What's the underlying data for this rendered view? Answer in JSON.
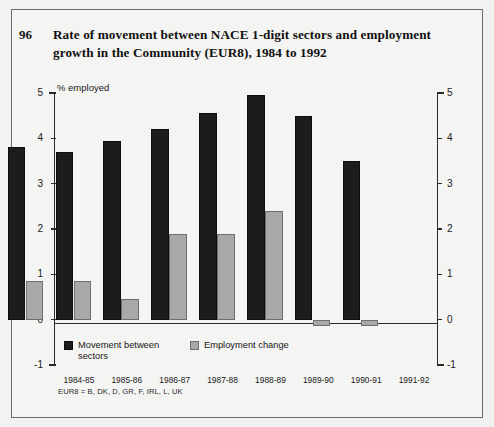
{
  "figure": {
    "number": "96",
    "title": "Rate of movement between NACE 1-digit sectors and employment growth in the Community (EUR8), 1984 to 1992",
    "unit_label": "% employed",
    "footnote": "EUR8 = B, DK, D, GR, F, IRL, L, UK"
  },
  "legend": {
    "items": [
      {
        "label": "Movement between sectors",
        "color": "#1c1c1c",
        "swatch": "black"
      },
      {
        "label": "Employment change",
        "color": "#a8a8a8",
        "swatch": "gray"
      }
    ]
  },
  "axis": {
    "y_ticks": [
      "5",
      "4",
      "3",
      "2",
      "1",
      "0",
      "-1"
    ],
    "y_ticks_right": [
      "5",
      "4",
      "3",
      "2",
      "1",
      "0",
      "-1"
    ]
  },
  "chart_data": {
    "type": "bar",
    "title": "Rate of movement between NACE 1-digit sectors and employment growth in the Community (EUR8), 1984 to 1992",
    "xlabel": "",
    "ylabel": "% employed",
    "ylim": [
      -1,
      5
    ],
    "ytick_step": 1,
    "grid": false,
    "legend_position": "bottom-left",
    "categories": [
      "1984-85",
      "1985-86",
      "1986-87",
      "1987-88",
      "1988-89",
      "1989-90",
      "1990-91",
      "1991-92"
    ],
    "series": [
      {
        "name": "Movement between sectors",
        "color": "#1c1c1c",
        "values": [
          3.8,
          3.7,
          3.95,
          4.2,
          4.55,
          4.95,
          4.5,
          3.5
        ]
      },
      {
        "name": "Employment change",
        "color": "#a8a8a8",
        "values": [
          0.85,
          0.85,
          0.45,
          1.88,
          1.88,
          2.4,
          -0.15,
          -0.15
        ]
      }
    ],
    "annotations": [
      "EUR8 = B, DK, D, GR, F, IRL, L, UK"
    ]
  }
}
